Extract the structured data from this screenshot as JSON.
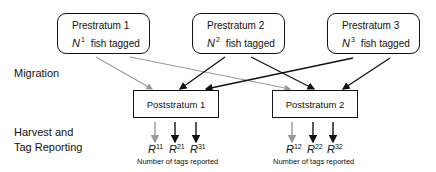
{
  "diagram": {
    "side_labels": {
      "migration": "Migration",
      "harvest_line1": "Harvest and",
      "harvest_line2": "Tag Reporting"
    },
    "prestrata": [
      {
        "title": "Prestratum 1",
        "var": "N",
        "sup": "1",
        "suffix": "fish tagged"
      },
      {
        "title": "Prestratum 2",
        "var": "N",
        "sup": "2",
        "suffix": "fish tagged"
      },
      {
        "title": "Prestratum 3",
        "var": "N",
        "sup": "3",
        "suffix": "fish tagged"
      }
    ],
    "poststrata": [
      {
        "title": "Poststratum 1",
        "reports": [
          {
            "var": "R",
            "sup": "11",
            "color": "#999999"
          },
          {
            "var": "R",
            "sup": "21",
            "color": "#111111"
          },
          {
            "var": "R",
            "sup": "31",
            "color": "#111111"
          }
        ],
        "caption": "Number of tags reported"
      },
      {
        "title": "Poststratum 2",
        "reports": [
          {
            "var": "R",
            "sup": "12",
            "color": "#999999"
          },
          {
            "var": "R",
            "sup": "22",
            "color": "#111111"
          },
          {
            "var": "R",
            "sup": "32",
            "color": "#111111"
          }
        ],
        "caption": "Number of tags reported"
      }
    ],
    "edges": [
      {
        "from": "Prestratum 1",
        "to": "Poststratum 1",
        "color": "#999999"
      },
      {
        "from": "Prestratum 1",
        "to": "Poststratum 2",
        "color": "#999999"
      },
      {
        "from": "Prestratum 2",
        "to": "Poststratum 1",
        "color": "#111111"
      },
      {
        "from": "Prestratum 2",
        "to": "Poststratum 2",
        "color": "#111111"
      },
      {
        "from": "Prestratum 3",
        "to": "Poststratum 1",
        "color": "#111111"
      },
      {
        "from": "Prestratum 3",
        "to": "Poststratum 2",
        "color": "#111111"
      }
    ]
  }
}
